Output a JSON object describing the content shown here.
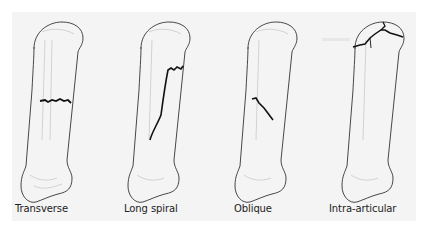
{
  "diagram": {
    "panels": [
      {
        "id": "transverse",
        "label": "Transverse",
        "fracture": "horizontal jagged line across mid-shaft"
      },
      {
        "id": "long-spiral",
        "label": "Long spiral",
        "fracture": "long curved line running down the shaft"
      },
      {
        "id": "oblique",
        "label": "Oblique",
        "fracture": "diagonal line across mid-shaft"
      },
      {
        "id": "intra-articular",
        "label": "Intra-articular",
        "fracture": "branching lines in the joint head"
      }
    ],
    "colors": {
      "background": "#ffffff",
      "panel": "#f4f4f4",
      "outline": "#333333",
      "fracture_line": "#111111",
      "faint_detail": "#b8b8b8"
    }
  }
}
